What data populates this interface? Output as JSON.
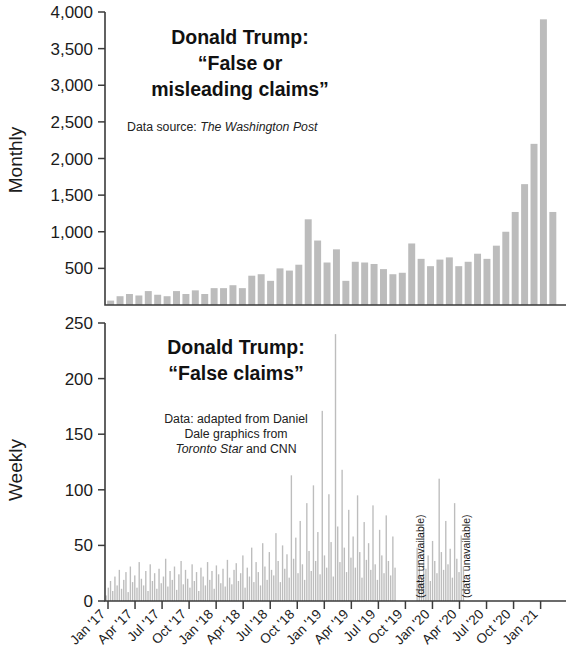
{
  "figure": {
    "width": 572,
    "height": 667,
    "background": "#ffffff",
    "bar_color": "#bcbcbc",
    "axis_color": "#3b3b3b"
  },
  "panels": {
    "top": {
      "title_line1": "Donald Trump:",
      "title_line2": "“False or",
      "title_line3": "misleading claims”",
      "source_prefix": "Data source: ",
      "source_italic": "The Washington Post",
      "ylabel": "Monthly"
    },
    "bottom": {
      "title_line1": "Donald Trump:",
      "title_line2": "“False claims”",
      "source_line1": "Data: adapted from Daniel",
      "source_line2": "Dale graphics from",
      "source_line3_italic": "Toronto Star",
      "source_line3_rest": " and CNN",
      "ylabel": "Weekly",
      "annotation_1": "(data unavailable)",
      "annotation_2": "(data unavailable)"
    }
  },
  "chart_data": [
    {
      "type": "bar",
      "title": "Donald Trump: “False or misleading claims”",
      "subtitle": "Data source: The Washington Post",
      "xlabel": "",
      "ylabel": "Monthly",
      "ylim": [
        0,
        4000
      ],
      "yticks": [
        0,
        500,
        1000,
        1500,
        2000,
        2500,
        3000,
        3500,
        4000
      ],
      "ytick_labels": [
        "",
        "500",
        "1,000",
        "1,500",
        "2,000",
        "2,500",
        "3,000",
        "3,500",
        "4,000"
      ],
      "grid": false,
      "legend": "none",
      "xlim_start": "2017-01",
      "xlim_end": "2021-01",
      "categories": [
        "Jan '17",
        "Feb '17",
        "Mar '17",
        "Apr '17",
        "May '17",
        "Jun '17",
        "Jul '17",
        "Aug '17",
        "Sep '17",
        "Oct '17",
        "Nov '17",
        "Dec '17",
        "Jan '18",
        "Feb '18",
        "Mar '18",
        "Apr '18",
        "May '18",
        "Jun '18",
        "Jul '18",
        "Aug '18",
        "Sep '18",
        "Oct '18",
        "Nov '18",
        "Dec '18",
        "Jan '19",
        "Feb '19",
        "Mar '19",
        "Apr '19",
        "May '19",
        "Jun '19",
        "Jul '19",
        "Aug '19",
        "Sep '19",
        "Oct '19",
        "Nov '19",
        "Dec '19",
        "Jan '20",
        "Feb '20",
        "Mar '20",
        "Apr '20",
        "May '20",
        "Jun '20",
        "Jul '20",
        "Aug '20",
        "Sep '20",
        "Oct '20",
        "Nov '20",
        "Dec '20"
      ],
      "values": [
        60,
        120,
        150,
        130,
        190,
        140,
        120,
        190,
        150,
        200,
        150,
        230,
        230,
        270,
        230,
        400,
        420,
        330,
        500,
        470,
        550,
        1170,
        880,
        580,
        760,
        330,
        590,
        580,
        560,
        490,
        420,
        440,
        840,
        630,
        530,
        620,
        650,
        530,
        590,
        700,
        630,
        810,
        1000,
        1270,
        1650,
        2200,
        3900,
        1270
      ]
    },
    {
      "type": "bar",
      "title": "Donald Trump: “False claims”",
      "subtitle": "Data: adapted from Daniel Dale graphics from Toronto Star and CNN",
      "xlabel": "",
      "ylabel": "Weekly",
      "ylim": [
        0,
        250
      ],
      "yticks": [
        0,
        50,
        100,
        150,
        200,
        250
      ],
      "ytick_labels": [
        "0",
        "50",
        "100",
        "150",
        "200",
        "250"
      ],
      "grid": false,
      "legend": "none",
      "annotations": [
        {
          "text": "(data unavailable)",
          "x": "Jul '19"
        },
        {
          "text": "(data unavailable)",
          "x": "Jan '20"
        }
      ],
      "note": "weekly series, 209 weeks Jan 2017 - Jan 2021; gaps shown as data unavailable",
      "values": [
        5,
        12,
        18,
        9,
        22,
        14,
        28,
        11,
        19,
        26,
        8,
        31,
        17,
        23,
        12,
        35,
        20,
        14,
        27,
        9,
        33,
        18,
        25,
        11,
        29,
        16,
        22,
        38,
        13,
        27,
        19,
        31,
        10,
        24,
        36,
        15,
        28,
        20,
        12,
        33,
        18,
        26,
        9,
        30,
        22,
        14,
        35,
        19,
        27,
        11,
        32,
        24,
        16,
        29,
        13,
        37,
        21,
        15,
        28,
        34,
        18,
        25,
        41,
        12,
        30,
        22,
        48,
        17,
        35,
        26,
        14,
        52,
        31,
        19,
        44,
        28,
        23,
        61,
        36,
        17,
        50,
        29,
        42,
        21,
        113,
        38,
        57,
        25,
        72,
        33,
        19,
        88,
        45,
        27,
        104,
        36,
        62,
        24,
        171,
        41,
        30,
        96,
        53,
        22,
        240,
        67,
        35,
        118,
        48,
        26,
        82,
        39,
        58,
        30,
        95,
        44,
        21,
        71,
        37,
        52,
        28,
        86,
        33,
        19,
        64,
        41,
        25,
        77,
        36,
        23,
        58,
        30,
        0,
        0,
        0,
        0,
        0,
        0,
        0,
        0,
        0,
        48,
        34,
        22,
        66,
        29,
        41,
        18,
        54,
        36,
        25,
        110,
        44,
        28,
        72,
        33,
        47,
        21,
        88,
        38,
        26,
        59,
        31,
        0,
        0,
        0,
        0,
        0,
        0,
        0,
        0,
        0,
        0,
        0,
        0,
        0,
        0,
        0,
        0,
        0,
        0,
        0,
        0,
        0,
        0,
        0,
        0,
        0,
        0,
        0,
        0,
        0,
        0,
        0,
        0,
        0,
        0,
        0,
        0,
        0,
        0,
        0,
        0,
        0,
        0,
        0,
        0,
        0,
        0
      ]
    }
  ],
  "xaxis": {
    "labels": [
      "Jan '17",
      "Apr '17",
      "Jul '17",
      "Oct '17",
      "Jan '18",
      "Apr '18",
      "Jul '18",
      "Oct '18",
      "Jan '19",
      "Apr '19",
      "Jul '19",
      "Oct '19",
      "Jan '20",
      "Apr '20",
      "Jul '20",
      "Oct '20",
      "Jan '21"
    ]
  }
}
